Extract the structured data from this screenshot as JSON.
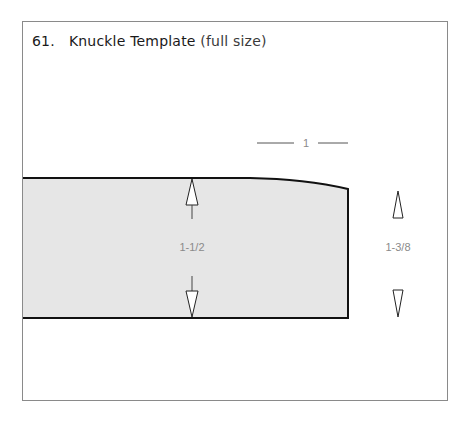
{
  "figure": {
    "number": "61.",
    "title": "Knuckle Template",
    "subtitle": "(full size)"
  },
  "template": {
    "fill_color": "#e6e6e6",
    "outline_color": "#111111"
  },
  "dimensions": {
    "width_label": "1",
    "left_height_label": "1-1/2",
    "right_height_label": "1-3/8"
  },
  "colors": {
    "frame_border": "#8a8a8a",
    "dimension_text": "#8a8a8a"
  }
}
